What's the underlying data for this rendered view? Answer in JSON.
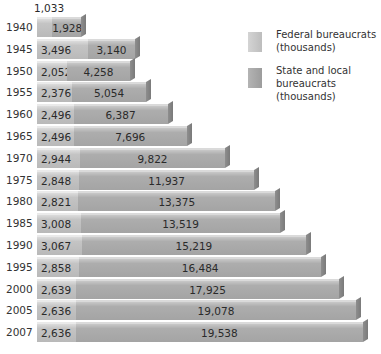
{
  "chart_data": {
    "type": "bar",
    "orientation": "horizontal",
    "stacked": true,
    "title": "",
    "xlabel": "",
    "ylabel": "",
    "grid": false,
    "legend_position": "top-right",
    "categories": [
      "1940",
      "1945",
      "1950",
      "1955",
      "1960",
      "1965",
      "1970",
      "1975",
      "1980",
      "1985",
      "1990",
      "1995",
      "2000",
      "2005",
      "2007"
    ],
    "series": [
      {
        "name": "Federal bureaucrats (thousands)",
        "color": "#c4c4c4",
        "values": [
          1033,
          3496,
          2052,
          2376,
          2496,
          2496,
          2944,
          2848,
          2821,
          3008,
          3067,
          2858,
          2639,
          2636,
          2636
        ],
        "labels": [
          "1,033",
          "3,496",
          "2,052",
          "2,376",
          "2,496",
          "2,496",
          "2,944",
          "2,848",
          "2,821",
          "3,008",
          "3,067",
          "2,858",
          "2,639",
          "2,636",
          "2,636"
        ]
      },
      {
        "name": "State and local bureaucrats (thousands)",
        "color": "#a8a8a8",
        "values": [
          1928,
          3140,
          4258,
          5054,
          6387,
          7696,
          9822,
          11937,
          13375,
          13519,
          15219,
          16484,
          17925,
          19078,
          19538
        ],
        "labels": [
          "1,928",
          "3,140",
          "4,258",
          "5,054",
          "6,387",
          "7,696",
          "9,822",
          "11,937",
          "13,375",
          "13,519",
          "15,219",
          "16,484",
          "17,925",
          "19,078",
          "19,538"
        ]
      }
    ]
  },
  "legend": {
    "federal": "Federal bureaucrats (thousands)",
    "state_local": "State and local bureaucrats (thousands)"
  }
}
